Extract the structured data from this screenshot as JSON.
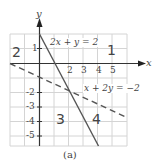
{
  "figure": {
    "caption": "(a)",
    "axes": {
      "x_label": "x",
      "y_label": "y",
      "x_ticks": [
        "2",
        "3",
        "4",
        "5"
      ],
      "y_ticks": [
        "1",
        "-2",
        "-3",
        "-4",
        "-5"
      ]
    },
    "lines": [
      {
        "equation": "2x + y = 2",
        "style": "solid",
        "color": "#555555"
      },
      {
        "equation": "x + 2y = −2",
        "style": "dashed",
        "color": "#555555"
      }
    ],
    "regions": [
      {
        "label": "1"
      },
      {
        "label": "2"
      },
      {
        "label": "3"
      },
      {
        "label": "4"
      }
    ],
    "grid_color": "#d0d0d0",
    "axis_color": "#333333"
  }
}
